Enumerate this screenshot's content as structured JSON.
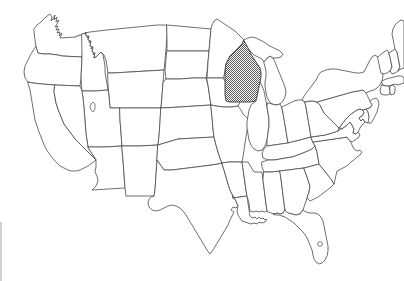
{
  "figure": {
    "kind": "choropleth-outline-map",
    "region": "United States (contiguous 48 states)",
    "title": "",
    "caption": "",
    "background_color": "#ffffff",
    "border_color": "#4a4a4a",
    "default_state_fill": "#ffffff",
    "highlight_fill": "#787878",
    "highlight_pattern": "dithered-checkerboard-gray",
    "highlighted_states": [
      "Wisconsin"
    ],
    "highlight_count": 1,
    "label_text_visible": "none",
    "legend_visible": "none",
    "alaska_hawaii_shown": "no"
  },
  "artifact": {
    "left_edge_streak_color": "#c9c9c9",
    "left_edge_streak_label": "scan-edge-streak"
  },
  "states": [
    {
      "code": "WA",
      "name": "Washington",
      "highlighted": false
    },
    {
      "code": "OR",
      "name": "Oregon",
      "highlighted": false
    },
    {
      "code": "CA",
      "name": "California",
      "highlighted": false
    },
    {
      "code": "NV",
      "name": "Nevada",
      "highlighted": false
    },
    {
      "code": "ID",
      "name": "Idaho",
      "highlighted": false
    },
    {
      "code": "MT",
      "name": "Montana",
      "highlighted": false
    },
    {
      "code": "WY",
      "name": "Wyoming",
      "highlighted": false
    },
    {
      "code": "UT",
      "name": "Utah",
      "highlighted": false
    },
    {
      "code": "AZ",
      "name": "Arizona",
      "highlighted": false
    },
    {
      "code": "CO",
      "name": "Colorado",
      "highlighted": false
    },
    {
      "code": "NM",
      "name": "New Mexico",
      "highlighted": false
    },
    {
      "code": "ND",
      "name": "North Dakota",
      "highlighted": false
    },
    {
      "code": "SD",
      "name": "South Dakota",
      "highlighted": false
    },
    {
      "code": "NE",
      "name": "Nebraska",
      "highlighted": false
    },
    {
      "code": "KS",
      "name": "Kansas",
      "highlighted": false
    },
    {
      "code": "OK",
      "name": "Oklahoma",
      "highlighted": false
    },
    {
      "code": "TX",
      "name": "Texas",
      "highlighted": false
    },
    {
      "code": "MN",
      "name": "Minnesota",
      "highlighted": false
    },
    {
      "code": "IA",
      "name": "Iowa",
      "highlighted": false
    },
    {
      "code": "MO",
      "name": "Missouri",
      "highlighted": false
    },
    {
      "code": "AR",
      "name": "Arkansas",
      "highlighted": false
    },
    {
      "code": "LA",
      "name": "Louisiana",
      "highlighted": false
    },
    {
      "code": "WI",
      "name": "Wisconsin",
      "highlighted": true
    },
    {
      "code": "IL",
      "name": "Illinois",
      "highlighted": false
    },
    {
      "code": "MI",
      "name": "Michigan",
      "highlighted": false
    },
    {
      "code": "IN",
      "name": "Indiana",
      "highlighted": false
    },
    {
      "code": "OH",
      "name": "Ohio",
      "highlighted": false
    },
    {
      "code": "KY",
      "name": "Kentucky",
      "highlighted": false
    },
    {
      "code": "TN",
      "name": "Tennessee",
      "highlighted": false
    },
    {
      "code": "MS",
      "name": "Mississippi",
      "highlighted": false
    },
    {
      "code": "AL",
      "name": "Alabama",
      "highlighted": false
    },
    {
      "code": "GA",
      "name": "Georgia",
      "highlighted": false
    },
    {
      "code": "FL",
      "name": "Florida",
      "highlighted": false
    },
    {
      "code": "SC",
      "name": "South Carolina",
      "highlighted": false
    },
    {
      "code": "NC",
      "name": "North Carolina",
      "highlighted": false
    },
    {
      "code": "VA",
      "name": "Virginia",
      "highlighted": false
    },
    {
      "code": "WV",
      "name": "West Virginia",
      "highlighted": false
    },
    {
      "code": "MD",
      "name": "Maryland",
      "highlighted": false
    },
    {
      "code": "DE",
      "name": "Delaware",
      "highlighted": false
    },
    {
      "code": "PA",
      "name": "Pennsylvania",
      "highlighted": false
    },
    {
      "code": "NJ",
      "name": "New Jersey",
      "highlighted": false
    },
    {
      "code": "NY",
      "name": "New York",
      "highlighted": false
    },
    {
      "code": "CT",
      "name": "Connecticut",
      "highlighted": false
    },
    {
      "code": "RI",
      "name": "Rhode Island",
      "highlighted": false
    },
    {
      "code": "MA",
      "name": "Massachusetts",
      "highlighted": false
    },
    {
      "code": "VT",
      "name": "Vermont",
      "highlighted": false
    },
    {
      "code": "NH",
      "name": "New Hampshire",
      "highlighted": false
    },
    {
      "code": "ME",
      "name": "Maine",
      "highlighted": false
    }
  ],
  "water_features": [
    {
      "name": "Great Salt Lake",
      "state": "UT"
    },
    {
      "name": "Lake Okeechobee",
      "state": "FL"
    }
  ]
}
